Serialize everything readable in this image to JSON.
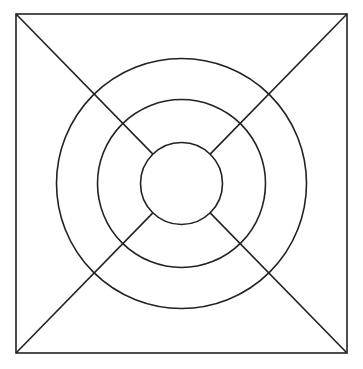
{
  "diagram": {
    "width": 363,
    "height": 369,
    "background": "#ffffff",
    "stroke_color": "#222222",
    "stroke_width": 1.6,
    "square": {
      "x1": 16,
      "y1": 14,
      "x2": 347,
      "y2": 353
    },
    "center": {
      "cx": 181.5,
      "cy": 183.5
    },
    "circles": [
      {
        "name": "outer-circle",
        "r": 125
      },
      {
        "name": "middle-circle",
        "r": 84
      },
      {
        "name": "inner-circle",
        "r": 41
      }
    ],
    "diagonals": [
      {
        "name": "diagonal-top-left",
        "from": "top-left-corner",
        "to": "inner-circle"
      },
      {
        "name": "diagonal-top-right",
        "from": "top-right-corner",
        "to": "inner-circle"
      },
      {
        "name": "diagonal-bottom-left",
        "from": "bottom-left-corner",
        "to": "inner-circle"
      },
      {
        "name": "diagonal-bottom-right",
        "from": "bottom-right-corner",
        "to": "inner-circle"
      }
    ]
  }
}
